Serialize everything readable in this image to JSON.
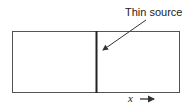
{
  "diagram": {
    "annotation": "Thin source",
    "axis_label": "x",
    "colors": {
      "stroke": "#333333",
      "background": "#ffffff"
    }
  }
}
